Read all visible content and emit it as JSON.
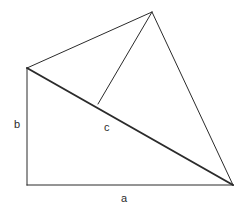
{
  "figure": {
    "background_color": "#ffffff",
    "stroke_color": "#2b2b2b",
    "canvas": {
      "width": 246,
      "height": 213
    },
    "labels": {
      "side_b": "b",
      "side_c": "c",
      "side_a": "a"
    },
    "label_positions": {
      "side_b": {
        "x": 18,
        "y": 125
      },
      "side_c": {
        "x": 108,
        "y": 128
      },
      "side_a": {
        "x": 125,
        "y": 199
      }
    },
    "vertices": {
      "left_top": {
        "x": 27,
        "y": 68
      },
      "bottom_left": {
        "x": 27,
        "y": 185
      },
      "bottom_right": {
        "x": 233,
        "y": 185
      },
      "apex_top": {
        "x": 152,
        "y": 12
      },
      "hypotenuse_junction": {
        "x": 98,
        "y": 104
      }
    },
    "segments": [
      {
        "name": "side-b-vertical",
        "from": "left_top",
        "to": "bottom_left",
        "weight": "thin"
      },
      {
        "name": "side-a-horizontal",
        "from": "bottom_left",
        "to": "bottom_right",
        "weight": "thin"
      },
      {
        "name": "side-c-hypotenuse",
        "from": "left_top",
        "to": "bottom_right",
        "weight": "thick"
      },
      {
        "name": "upper-left-edge",
        "from": "left_top",
        "to": "apex_top",
        "weight": "thin"
      },
      {
        "name": "apex-to-junction",
        "from": "apex_top",
        "to": "hypotenuse_junction",
        "weight": "thin"
      },
      {
        "name": "apex-to-bottom-right",
        "from": "apex_top",
        "to": "bottom_right",
        "weight": "thin"
      }
    ],
    "stroke_widths": {
      "thin": 1,
      "thick": 2
    }
  }
}
